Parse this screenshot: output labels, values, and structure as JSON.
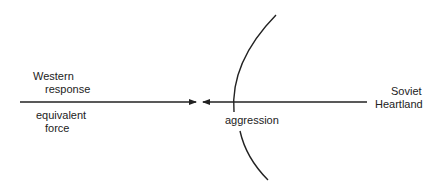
{
  "labels": {
    "western_line1": "Western",
    "western_line2": "response",
    "equivalent_line1": "equivalent",
    "equivalent_line2": "force",
    "aggression": "aggression",
    "soviet_line1": "Soviet",
    "soviet_line2": "Heartland"
  },
  "colors": {
    "stroke": "#222222",
    "background": "#ffffff"
  }
}
